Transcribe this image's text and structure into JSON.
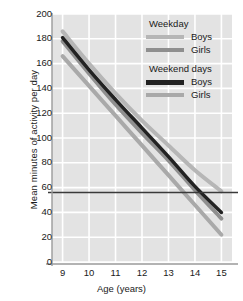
{
  "chart_data": {
    "type": "line",
    "title": "",
    "xlabel": "Age (years)",
    "ylabel": "Mean minutes of activity per day",
    "x": [
      9,
      10,
      11,
      12,
      13,
      14,
      15
    ],
    "xlim": [
      8.6,
      15.4
    ],
    "ylim": [
      0,
      200
    ],
    "ytick_labels": [
      "200",
      "180",
      "160",
      "140",
      "120",
      "100",
      "80",
      "60",
      "40",
      "20",
      "0"
    ],
    "ytick_values": [
      200,
      180,
      160,
      140,
      120,
      100,
      80,
      60,
      40,
      20,
      0
    ],
    "xtick_labels": [
      "9",
      "10",
      "11",
      "12",
      "13",
      "14",
      "15"
    ],
    "grid": true,
    "grid_color": "#ffffff",
    "plot_background": "#e3e3e3",
    "legend_position": "top-right",
    "series": [
      {
        "name": "Weekday Boys",
        "group": "Weekday",
        "label": "Boys",
        "color": "#b6b6b6",
        "width": 4,
        "values": [
          186,
          160,
          136,
          114,
          94,
          74,
          57
        ]
      },
      {
        "name": "Weekday Girls",
        "group": "Weekday",
        "label": "Girls",
        "color": "#8f8f8f",
        "width": 4,
        "values": [
          178,
          152,
          127,
          104,
          82,
          58,
          35
        ]
      },
      {
        "name": "Weekend days Boys",
        "group": "Weekend days",
        "label": "Boys",
        "color": "#222222",
        "width": 3.5,
        "values": [
          181,
          155,
          131,
          108,
          85,
          61,
          40
        ]
      },
      {
        "name": "Weekend days Girls",
        "group": "Weekend days",
        "label": "Girls",
        "color": "#a9a9a9",
        "width": 4,
        "values": [
          166,
          142,
          118,
          94,
          70,
          46,
          22
        ]
      }
    ],
    "reference_line": {
      "name": "guideline-60-minutes",
      "orientation": "horizontal",
      "value": 56,
      "color": "#3a3a3a"
    }
  },
  "legend": {
    "groups": [
      {
        "title": "Weekday",
        "entries": [
          {
            "label": "Boys",
            "color": "#b6b6b6",
            "thick": false
          },
          {
            "label": "Girls",
            "color": "#8f8f8f",
            "thick": false
          }
        ]
      },
      {
        "title": "Weekend days",
        "entries": [
          {
            "label": "Boys",
            "color": "#222222",
            "thick": true
          },
          {
            "label": "Girls",
            "color": "#a9a9a9",
            "thick": false
          }
        ]
      }
    ]
  }
}
